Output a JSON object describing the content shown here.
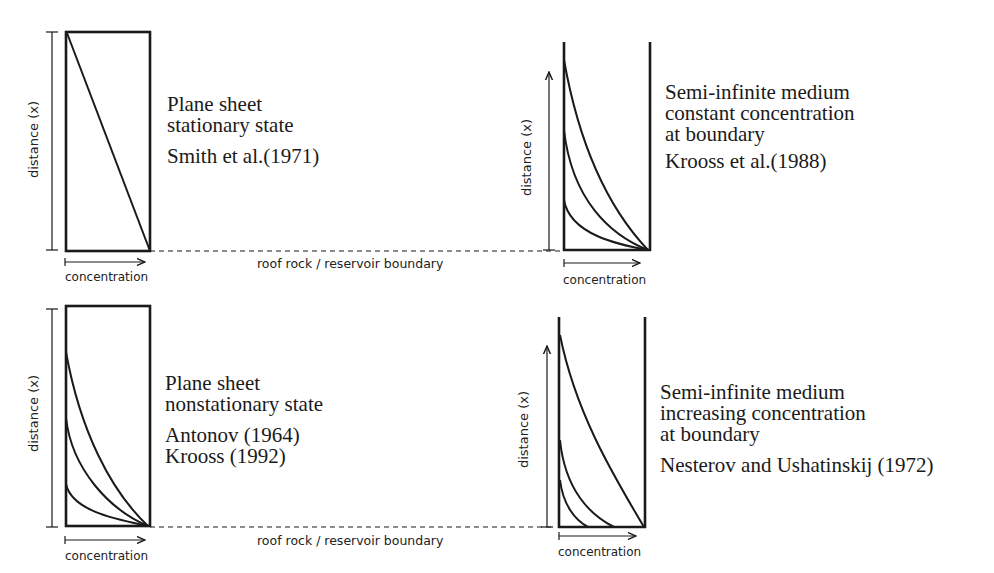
{
  "panels": [
    {
      "id": "plane-sheet-stationary",
      "title_lines": [
        "Plane sheet",
        "stationary state"
      ],
      "references": [
        "Smith et al.(1971)"
      ],
      "y_axis_label": "distance (x)",
      "x_axis_label": "concentration",
      "profile_count": 1
    },
    {
      "id": "semi-infinite-constant",
      "title_lines": [
        "Semi-infinite medium",
        "constant concentration",
        "at boundary"
      ],
      "references": [
        "Krooss et al.(1988)"
      ],
      "y_axis_label": "distance (x)",
      "x_axis_label": "concentration",
      "profile_count": 3
    },
    {
      "id": "plane-sheet-nonstationary",
      "title_lines": [
        "Plane sheet",
        "nonstationary state"
      ],
      "references": [
        "Antonov (1964)",
        "Krooss (1992)"
      ],
      "y_axis_label": "distance (x)",
      "x_axis_label": "concentration",
      "profile_count": 3
    },
    {
      "id": "semi-infinite-increasing",
      "title_lines": [
        "Semi-infinite medium",
        "increasing concentration",
        "at boundary"
      ],
      "references": [
        "Nesterov and Ushatinskij (1972)"
      ],
      "y_axis_label": "distance (x)",
      "x_axis_label": "concentration",
      "profile_count": 3
    }
  ],
  "boundary_labels": {
    "top": "roof rock / reservoir boundary",
    "bottom": "roof rock / reservoir boundary"
  },
  "colors": {
    "line": "#1a1a1a",
    "background": "#ffffff"
  }
}
